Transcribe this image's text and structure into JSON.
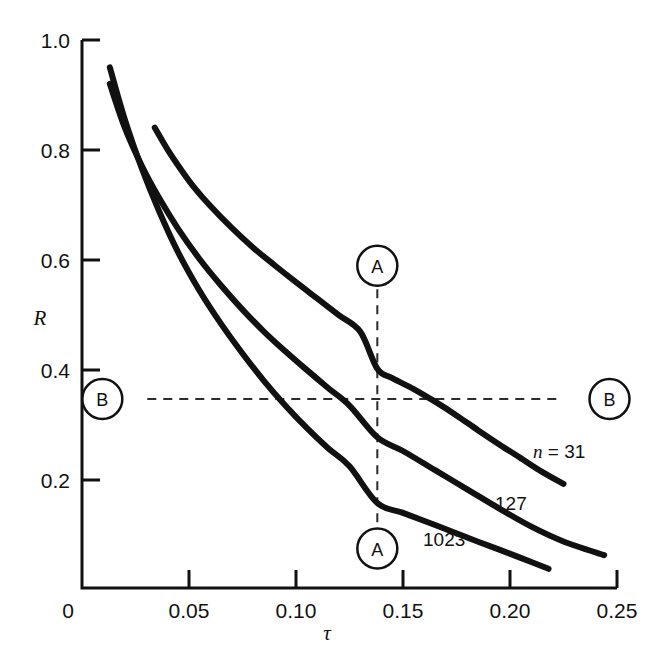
{
  "chart_data": {
    "type": "line",
    "title": "",
    "subtitle": "",
    "xlabel": "τ",
    "ylabel": "R",
    "xlim": [
      0,
      0.25
    ],
    "ylim": [
      0,
      1.0
    ],
    "grid": false,
    "legend_position": "inline-curve-labels",
    "x_ticks": [
      {
        "value": 0,
        "label": "0"
      },
      {
        "value": 0.05,
        "label": "0.05"
      },
      {
        "value": 0.1,
        "label": "0.10"
      },
      {
        "value": 0.15,
        "label": "0.15"
      },
      {
        "value": 0.2,
        "label": "0.20"
      },
      {
        "value": 0.25,
        "label": "0.25"
      }
    ],
    "y_ticks": [
      {
        "value": 0,
        "label": "0"
      },
      {
        "value": 0.2,
        "label": "0.2"
      },
      {
        "value": 0.4,
        "label": "0.4"
      },
      {
        "value": 0.6,
        "label": "0.6"
      },
      {
        "value": 0.8,
        "label": "0.8"
      },
      {
        "value": 1.0,
        "label": "1.0"
      }
    ],
    "series": [
      {
        "name": "n = 31",
        "label": "n = 31",
        "label_prefix_italic": "n",
        "label_rest": " = 31",
        "n": 31,
        "color": "#111111",
        "points": [
          [
            0.034,
            0.84
          ],
          [
            0.04,
            0.8
          ],
          [
            0.046,
            0.765
          ],
          [
            0.052,
            0.733
          ],
          [
            0.06,
            0.697
          ],
          [
            0.07,
            0.657
          ],
          [
            0.08,
            0.621
          ],
          [
            0.09,
            0.589
          ],
          [
            0.1,
            0.558
          ],
          [
            0.11,
            0.528
          ],
          [
            0.12,
            0.498
          ],
          [
            0.13,
            0.468
          ],
          [
            0.138,
            0.4
          ],
          [
            0.145,
            0.383
          ],
          [
            0.155,
            0.363
          ],
          [
            0.165,
            0.34
          ],
          [
            0.175,
            0.315
          ],
          [
            0.185,
            0.288
          ],
          [
            0.195,
            0.262
          ],
          [
            0.205,
            0.237
          ],
          [
            0.215,
            0.212
          ],
          [
            0.225,
            0.19
          ]
        ]
      },
      {
        "name": "127",
        "label": "127",
        "n": 127,
        "color": "#111111",
        "points": [
          [
            0.013,
            0.92
          ],
          [
            0.02,
            0.84
          ],
          [
            0.028,
            0.77
          ],
          [
            0.036,
            0.712
          ],
          [
            0.045,
            0.655
          ],
          [
            0.055,
            0.6
          ],
          [
            0.065,
            0.552
          ],
          [
            0.075,
            0.508
          ],
          [
            0.085,
            0.468
          ],
          [
            0.095,
            0.432
          ],
          [
            0.105,
            0.398
          ],
          [
            0.115,
            0.365
          ],
          [
            0.125,
            0.333
          ],
          [
            0.138,
            0.275
          ],
          [
            0.15,
            0.25
          ],
          [
            0.165,
            0.215
          ],
          [
            0.18,
            0.18
          ],
          [
            0.195,
            0.145
          ],
          [
            0.21,
            0.112
          ],
          [
            0.225,
            0.085
          ],
          [
            0.244,
            0.06
          ]
        ]
      },
      {
        "name": "1023",
        "label": "1023",
        "n": 1023,
        "color": "#111111",
        "points": [
          [
            0.013,
            0.95
          ],
          [
            0.02,
            0.855
          ],
          [
            0.028,
            0.765
          ],
          [
            0.036,
            0.688
          ],
          [
            0.045,
            0.612
          ],
          [
            0.055,
            0.542
          ],
          [
            0.065,
            0.482
          ],
          [
            0.075,
            0.428
          ],
          [
            0.085,
            0.378
          ],
          [
            0.095,
            0.333
          ],
          [
            0.105,
            0.292
          ],
          [
            0.115,
            0.255
          ],
          [
            0.125,
            0.222
          ],
          [
            0.138,
            0.155
          ],
          [
            0.15,
            0.137
          ],
          [
            0.165,
            0.115
          ],
          [
            0.18,
            0.092
          ],
          [
            0.195,
            0.07
          ],
          [
            0.205,
            0.055
          ],
          [
            0.218,
            0.035
          ]
        ]
      }
    ],
    "annotations": [
      {
        "id": "A",
        "letter": "A",
        "type": "vertical-construction-line",
        "x": 0.138,
        "y_top": 0.545,
        "y_bottom": 0.115,
        "top_circle_y": 0.588,
        "bottom_circle_y": 0.072
      },
      {
        "id": "B",
        "letter": "B",
        "type": "horizontal-construction-line",
        "y": 0.345,
        "x_left": 0.0305,
        "x_right": 0.2245,
        "left_circle_x": 0.0095,
        "right_circle_x": 0.2465
      }
    ],
    "intersections_at_A": [
      {
        "series": "n = 31",
        "tau": 0.138,
        "R": 0.4
      },
      {
        "series": "127",
        "tau": 0.138,
        "R": 0.275
      },
      {
        "series": "1023",
        "tau": 0.138,
        "R": 0.155
      }
    ],
    "intersections_at_B": [
      {
        "series": "n = 31",
        "R": 0.345,
        "tau": 0.162
      },
      {
        "series": "127",
        "R": 0.345,
        "tau": 0.122
      },
      {
        "series": "1023",
        "R": 0.345,
        "tau": 0.0915
      }
    ]
  },
  "labels": {
    "y_axis_title": "R",
    "x_axis_title": "τ",
    "callout_a": "A",
    "callout_b": "B",
    "curve_n31_italic": "n",
    "curve_n31_rest": " = 31",
    "curve_n127": "127",
    "curve_n1023": "1023",
    "xtick_0": "0",
    "xtick_005": "0.05",
    "xtick_010": "0.10",
    "xtick_015": "0.15",
    "xtick_020": "0.20",
    "xtick_025": "0.25",
    "ytick_0": "0",
    "ytick_02": "0.2",
    "ytick_04": "0.4",
    "ytick_06": "0.6",
    "ytick_08": "0.8",
    "ytick_10": "1.0"
  },
  "colors": {
    "ink": "#111111",
    "background": "#ffffff",
    "curve": "#111111",
    "dashed": "#2b2b2b"
  }
}
